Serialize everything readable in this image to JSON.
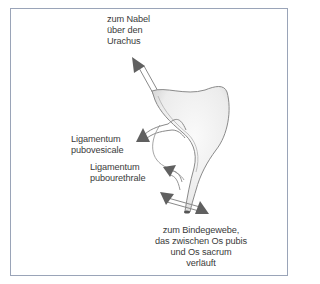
{
  "figure": {
    "labels": {
      "urachus": {
        "lines": [
          "zum Nabel",
          "über den",
          "Urachus"
        ]
      },
      "pubovesicale": {
        "lines": [
          "Ligamentum",
          "pubovesicale"
        ]
      },
      "pubourethrale": {
        "lines": [
          "Ligamentum",
          "pubourethrale"
        ]
      },
      "bindegewebe": {
        "lines": [
          "zum Bindegewebe,",
          "das zwischen Os pubis",
          "und Os sacrum",
          "verläuft"
        ]
      }
    },
    "colors": {
      "frame": "#9aa4b8",
      "arrow": "#606060",
      "organ_fill": "#f0f0f0",
      "organ_stroke": "#8a8a8a",
      "text": "#3a3a3a"
    }
  }
}
